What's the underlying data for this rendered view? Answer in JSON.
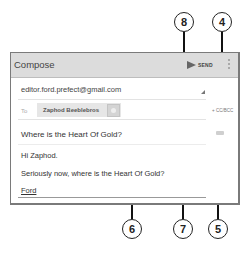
{
  "app": {
    "title": "Compose",
    "send_label": "SEND",
    "overflow_icon": "vertical-dots-icon"
  },
  "compose": {
    "from": "editor.ford.prefect@gmail.com",
    "to_label": "To",
    "recipients": [
      {
        "name": "Zaphod Beeblebros"
      }
    ],
    "cc_bcc_label": "+ CC/BCC",
    "subject": "Where is the Heart Of Gold?",
    "body": [
      "Hi Zaphod.",
      "Seriously now, where is the Heart Of Gold?",
      "Ford"
    ]
  },
  "callouts": {
    "send": "8",
    "cc_bcc": "4",
    "subject": "6",
    "body": "7",
    "attach": "5"
  },
  "colors": {
    "header_bg": "#dcdcdc",
    "frame_border": "#7a7a7a",
    "callout_stroke": "#222222"
  }
}
